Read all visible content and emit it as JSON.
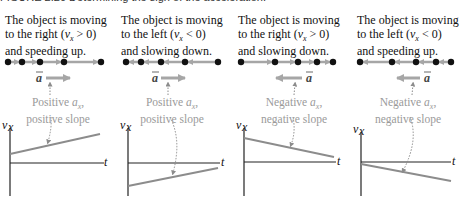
{
  "figure": {
    "title_partial": "FIGURE 2.20 Determining the sign of the acceleration."
  },
  "panels": [
    {
      "id": "right-speeding-up",
      "desc_line1": "The object is moving",
      "desc_line2_pre": "to the right (",
      "desc_var": "v",
      "desc_sub": "x",
      "desc_rel": " > 0)",
      "desc_line3": "and speeding up.",
      "accel_label": "a",
      "accel_direction": "right",
      "caption_line1_pre": "Positive ",
      "caption_var": "a",
      "caption_sub": "x",
      "caption_line1_post": ",",
      "caption_line2": "positive slope",
      "graph": {
        "ylabel": "v",
        "ysub": "x",
        "xlabel": "t",
        "slope": "positive",
        "v_intercept_sign": "positive"
      }
    },
    {
      "id": "left-slowing-down",
      "desc_line1": "The object is moving",
      "desc_line2_pre": "to the left (",
      "desc_var": "v",
      "desc_sub": "x",
      "desc_rel": " < 0)",
      "desc_line3": "and slowing down.",
      "accel_label": "a",
      "accel_direction": "right",
      "caption_line1_pre": "Positive ",
      "caption_var": "a",
      "caption_sub": "x",
      "caption_line1_post": ",",
      "caption_line2": "positive slope",
      "graph": {
        "ylabel": "v",
        "ysub": "x",
        "xlabel": "t",
        "slope": "positive",
        "v_intercept_sign": "negative"
      }
    },
    {
      "id": "right-slowing-down",
      "desc_line1": "The object is moving",
      "desc_line2_pre": "to the right (",
      "desc_var": "v",
      "desc_sub": "x",
      "desc_rel": " > 0)",
      "desc_line3": "and slowing down.",
      "accel_label": "a",
      "accel_direction": "left",
      "caption_line1_pre": "Negative ",
      "caption_var": "a",
      "caption_sub": "x",
      "caption_line1_post": ",",
      "caption_line2": "negative slope",
      "graph": {
        "ylabel": "v",
        "ysub": "x",
        "xlabel": "t",
        "slope": "negative",
        "v_intercept_sign": "positive"
      }
    },
    {
      "id": "left-speeding-up",
      "desc_line1": "The object is moving",
      "desc_line2_pre": "to the left (",
      "desc_var": "v",
      "desc_sub": "x",
      "desc_rel": " < 0)",
      "desc_line3": "and speeding up.",
      "accel_label": "a",
      "accel_direction": "left",
      "caption_line1_pre": "Negative ",
      "caption_var": "a",
      "caption_sub": "x",
      "caption_line1_post": ",",
      "caption_line2": "negative slope",
      "graph": {
        "ylabel": "v",
        "ysub": "x",
        "xlabel": "t",
        "slope": "negative",
        "v_intercept_sign": "negative"
      }
    }
  ],
  "colors": {
    "text": "#111111",
    "caption": "#9a9a9a",
    "arrow_gray": "#a6a6a6",
    "dot": "#111111",
    "axis": "#222222",
    "graph_line": "#8c8c8c"
  }
}
